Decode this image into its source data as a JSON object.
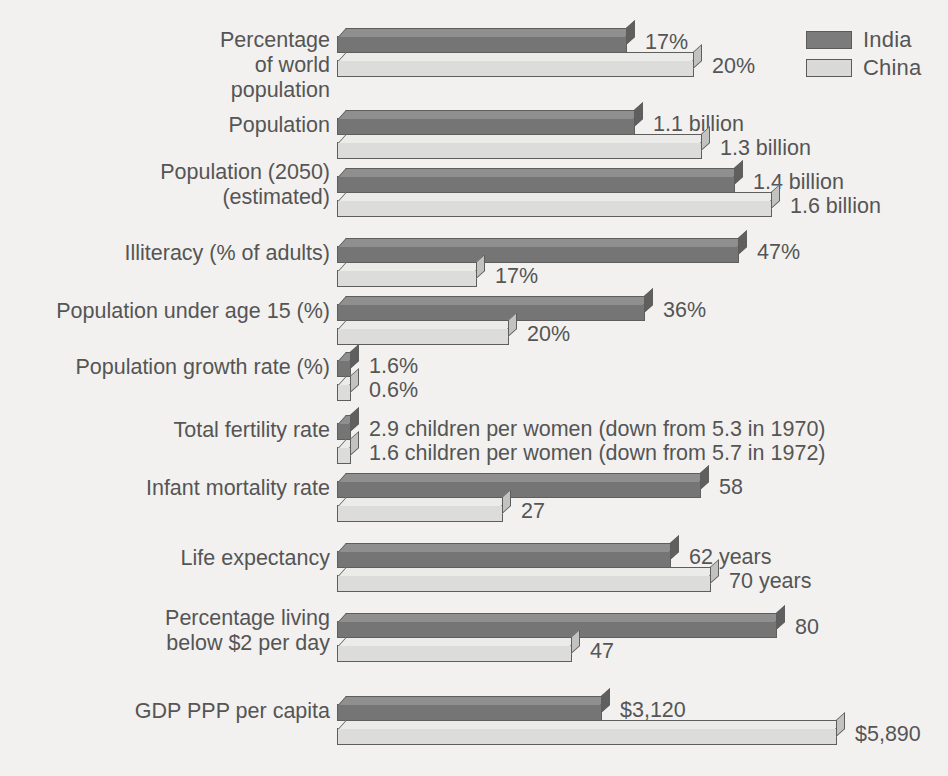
{
  "legend": {
    "title": "",
    "entries": [
      {
        "label": "India",
        "color": "#757575",
        "key": "india"
      },
      {
        "label": "China",
        "color": "#dcdcda",
        "key": "china"
      }
    ]
  },
  "chart_data": {
    "type": "bar",
    "orientation": "horizontal",
    "title": "",
    "xlabel": "",
    "ylabel": "",
    "grid": false,
    "legend_position": "top-right",
    "series": [
      {
        "name": "India",
        "color": "#757575"
      },
      {
        "name": "China",
        "color": "#dcdcda"
      }
    ],
    "categories": [
      "Percentage\nof world\npopulation",
      "Population",
      "Population (2050)\n(estimated)",
      "Illiteracy (% of adults)",
      "Population under age 15 (%)",
      "Population growth rate (%)",
      "Total fertility rate",
      "Infant mortality rate",
      "Life expectancy",
      "Percentage living\nbelow $2 per day",
      "GDP PPP per capita"
    ],
    "rows": [
      {
        "category": "Percentage\nof world\npopulation",
        "top": 28,
        "label_top": 28,
        "india": {
          "value": 17,
          "display": "17%",
          "width": 290
        },
        "china": {
          "value": 20,
          "display": "20%",
          "width": 357
        }
      },
      {
        "category": "Population",
        "top": 110,
        "label_top": 113,
        "india": {
          "value": 1.1,
          "display": "1.1 billion",
          "width": 298
        },
        "china": {
          "value": 1.3,
          "display": "1.3 billion",
          "width": 365
        }
      },
      {
        "category": "Population (2050)\n(estimated)",
        "top": 168,
        "label_top": 160,
        "india": {
          "value": 1.4,
          "display": "1.4 billion",
          "width": 398
        },
        "china": {
          "value": 1.6,
          "display": "1.6 billion",
          "width": 435
        }
      },
      {
        "category": "Illiteracy (% of adults)",
        "top": 238,
        "label_top": 241,
        "india": {
          "value": 47,
          "display": "47%",
          "width": 402
        },
        "china": {
          "value": 17,
          "display": "17%",
          "width": 140
        }
      },
      {
        "category": "Population under age 15 (%)",
        "top": 296,
        "label_top": 299,
        "india": {
          "value": 36,
          "display": "36%",
          "width": 308
        },
        "china": {
          "value": 20,
          "display": "20%",
          "width": 172
        }
      },
      {
        "category": "Population growth rate (%)",
        "top": 352,
        "label_top": 355,
        "india": {
          "value": 1.6,
          "display": "1.6%",
          "width": 14
        },
        "china": {
          "value": 0.6,
          "display": "0.6%",
          "width": 14
        }
      },
      {
        "category": "Total fertility rate",
        "top": 415,
        "label_top": 418,
        "india": {
          "value": 2.9,
          "display": "2.9 children per women (down from 5.3 in 1970)",
          "width": 14
        },
        "china": {
          "value": 1.6,
          "display": "1.6 children per women (down from 5.7 in 1972)",
          "width": 14
        }
      },
      {
        "category": "Infant mortality rate",
        "top": 473,
        "label_top": 476,
        "india": {
          "value": 58,
          "display": "58",
          "width": 364
        },
        "china": {
          "value": 27,
          "display": "27",
          "width": 166
        }
      },
      {
        "category": "Life expectancy",
        "top": 543,
        "label_top": 546,
        "india": {
          "value": 62,
          "display": "62 years",
          "width": 334
        },
        "china": {
          "value": 70,
          "display": "70 years",
          "width": 374
        }
      },
      {
        "category": "Percentage living\nbelow $2 per day",
        "top": 613,
        "label_top": 606,
        "india": {
          "value": 80,
          "display": "80",
          "width": 440
        },
        "china": {
          "value": 47,
          "display": "47",
          "width": 235
        }
      },
      {
        "category": "GDP PPP per capita",
        "top": 696,
        "label_top": 699,
        "india": {
          "value": 3120,
          "display": "$3,120",
          "width": 265
        },
        "china": {
          "value": 5890,
          "display": "$5,890",
          "width": 500
        }
      }
    ]
  }
}
